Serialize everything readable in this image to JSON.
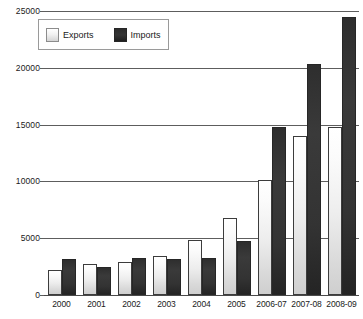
{
  "chart_data": {
    "type": "bar",
    "title": "",
    "subtitle": "",
    "xlabel": "",
    "ylabel": "",
    "ylim": [
      0,
      25000
    ],
    "ytick_step": 5000,
    "yticks": [
      "0",
      "5000",
      "10000",
      "15000",
      "20000",
      "25000"
    ],
    "grid": true,
    "legend_position": "top-left",
    "categories": [
      "2000",
      "2001",
      "2002",
      "2003",
      "2004",
      "2005",
      "2006-07",
      "2007-08",
      "2008-09"
    ],
    "series": [
      {
        "name": "Exports",
        "color": "#ededed",
        "values": [
          2200,
          2750,
          2900,
          3450,
          4800,
          6800,
          10100,
          14000,
          14800
        ]
      },
      {
        "name": "Imports",
        "color": "#333333",
        "values": [
          3200,
          2450,
          3250,
          3200,
          3300,
          4750,
          14750,
          20300,
          24500
        ]
      }
    ]
  },
  "legend": {
    "entries": [
      {
        "label": "Exports",
        "swatch": "exports-swatch-icon"
      },
      {
        "label": "Imports",
        "swatch": "imports-swatch-icon"
      }
    ]
  },
  "colors": {
    "axis": "#5d5d5d",
    "text": "#1a1a1a",
    "exports_fill": "#ededed",
    "exports_stroke": "#3c3c3c",
    "imports_fill": "#333333",
    "legend_border": "#9a9a9a",
    "background": "#ffffff"
  }
}
